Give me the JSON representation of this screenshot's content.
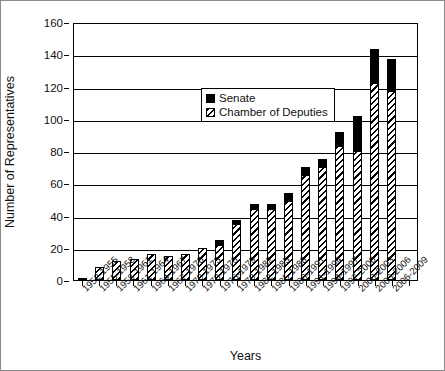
{
  "axes": {
    "ylabel": "Number of Representatives",
    "xlabel": "Years",
    "yticks": [
      0,
      20,
      40,
      60,
      80,
      100,
      120,
      140,
      160
    ]
  },
  "legend": {
    "items": [
      {
        "label": "Senate",
        "key": "senate-swatch",
        "color": "#000000"
      },
      {
        "label": "Chamber of Deputies",
        "key": "chamber-swatch",
        "color": "#000000"
      }
    ]
  },
  "chart_data": {
    "type": "bar",
    "title": "",
    "xlabel": "Years",
    "ylabel": "Number of Representatives",
    "ylim": [
      0,
      160
    ],
    "ytick_step": 20,
    "grid": true,
    "stacked": true,
    "legend_position": "inside-upper-left",
    "categories": [
      "1952-1955",
      "1955-1958",
      "1958-1961",
      "1961-1964",
      "1964-1967",
      "1967-1970",
      "1970-1973",
      "1973-1976",
      "1976-1979",
      "1979-1982",
      "1982-1985",
      "1985-1988",
      "1988-1991",
      "1991-1994",
      "1994-1997",
      "1997-2000",
      "2000-2003",
      "2003-2006",
      "2006-2009",
      "2006-2009b"
    ],
    "series": [
      {
        "name": "Chamber of Deputies",
        "values": [
          1,
          8,
          12,
          13,
          16,
          15,
          16,
          20,
          22,
          35,
          44,
          44,
          49,
          65,
          70,
          83,
          80,
          122,
          117,
          0
        ]
      },
      {
        "name": "Senate",
        "values": [
          0,
          0,
          0,
          0,
          0,
          0,
          0,
          0,
          3,
          2,
          3,
          3,
          5,
          5,
          5,
          9,
          22,
          21,
          20,
          0
        ]
      }
    ],
    "totals": [
      1,
      8,
      12,
      13,
      16,
      15,
      16,
      20,
      25,
      37,
      47,
      47,
      54,
      70,
      75,
      92,
      102,
      143,
      137,
      0
    ]
  }
}
